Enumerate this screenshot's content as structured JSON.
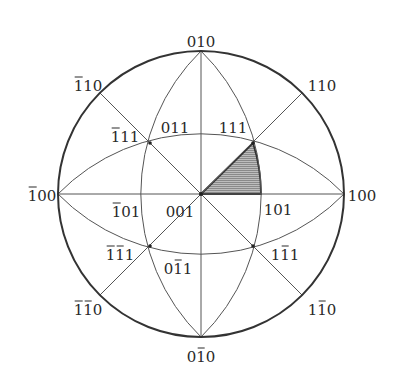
{
  "diagram": {
    "type": "stereographic-projection",
    "title": "",
    "colors": {
      "line": "#555555",
      "primitive_circle": "#333333",
      "shading": "#9a9a9a",
      "text": "#2a2a2a"
    },
    "center": [
      201,
      194
    ],
    "radius": 143,
    "shaded_region": {
      "description": "standard stereographic triangle 001-101-111",
      "vertices": [
        "001",
        "101",
        "111"
      ]
    },
    "poles": [
      {
        "id": "p010",
        "label": "010",
        "digits": [
          {
            "c": "0",
            "bar": false
          },
          {
            "c": "1",
            "bar": false
          },
          {
            "c": "0",
            "bar": false
          }
        ],
        "pos": [
          201,
          42
        ]
      },
      {
        "id": "p0m10",
        "label": "0̅1̅0",
        "digits": [
          {
            "c": "0",
            "bar": false
          },
          {
            "c": "1",
            "bar": true
          },
          {
            "c": "0",
            "bar": false
          }
        ],
        "pos": [
          201,
          357
        ]
      },
      {
        "id": "pm100",
        "label": "̅1 00",
        "digits": [
          {
            "c": "1",
            "bar": true
          },
          {
            "c": "0",
            "bar": false
          },
          {
            "c": "0",
            "bar": false
          }
        ],
        "pos": [
          42,
          196
        ]
      },
      {
        "id": "p100",
        "label": "100",
        "digits": [
          {
            "c": "1",
            "bar": false
          },
          {
            "c": "0",
            "bar": false
          },
          {
            "c": "0",
            "bar": false
          }
        ],
        "pos": [
          362,
          196
        ]
      },
      {
        "id": "pm110",
        "label": "-110",
        "digits": [
          {
            "c": "1",
            "bar": true
          },
          {
            "c": "1",
            "bar": false
          },
          {
            "c": "0",
            "bar": false
          }
        ],
        "pos": [
          88,
          86
        ]
      },
      {
        "id": "p110",
        "label": "110",
        "digits": [
          {
            "c": "1",
            "bar": false
          },
          {
            "c": "1",
            "bar": false
          },
          {
            "c": "0",
            "bar": false
          }
        ],
        "pos": [
          322,
          86
        ]
      },
      {
        "id": "pm1m10",
        "label": "-1-10",
        "digits": [
          {
            "c": "1",
            "bar": true
          },
          {
            "c": "1",
            "bar": true
          },
          {
            "c": "0",
            "bar": false
          }
        ],
        "pos": [
          88,
          310
        ]
      },
      {
        "id": "p1m10",
        "label": "1-10",
        "digits": [
          {
            "c": "1",
            "bar": false
          },
          {
            "c": "1",
            "bar": true
          },
          {
            "c": "0",
            "bar": false
          }
        ],
        "pos": [
          322,
          310
        ]
      },
      {
        "id": "pm111",
        "label": "-111",
        "digits": [
          {
            "c": "1",
            "bar": true
          },
          {
            "c": "1",
            "bar": false
          },
          {
            "c": "1",
            "bar": false
          }
        ],
        "pos": [
          125,
          137
        ]
      },
      {
        "id": "p011",
        "label": "011",
        "digits": [
          {
            "c": "0",
            "bar": false
          },
          {
            "c": "1",
            "bar": false
          },
          {
            "c": "1",
            "bar": false
          }
        ],
        "pos": [
          175,
          128
        ]
      },
      {
        "id": "p111",
        "label": "111",
        "digits": [
          {
            "c": "1",
            "bar": false
          },
          {
            "c": "1",
            "bar": false
          },
          {
            "c": "1",
            "bar": false
          }
        ],
        "pos": [
          233,
          128
        ]
      },
      {
        "id": "pm101",
        "label": "-101",
        "digits": [
          {
            "c": "1",
            "bar": true
          },
          {
            "c": "0",
            "bar": false
          },
          {
            "c": "1",
            "bar": false
          }
        ],
        "pos": [
          126,
          212
        ]
      },
      {
        "id": "p001",
        "label": "001",
        "digits": [
          {
            "c": "0",
            "bar": false
          },
          {
            "c": "0",
            "bar": false
          },
          {
            "c": "1",
            "bar": false
          }
        ],
        "pos": [
          180,
          212
        ]
      },
      {
        "id": "p101",
        "label": "101",
        "digits": [
          {
            "c": "1",
            "bar": false
          },
          {
            "c": "0",
            "bar": false
          },
          {
            "c": "1",
            "bar": false
          }
        ],
        "pos": [
          278,
          210
        ]
      },
      {
        "id": "pm1m11",
        "label": "-1-11",
        "digits": [
          {
            "c": "1",
            "bar": true
          },
          {
            "c": "1",
            "bar": true
          },
          {
            "c": "1",
            "bar": false
          }
        ],
        "pos": [
          120,
          255
        ]
      },
      {
        "id": "p0m11",
        "label": "0-11",
        "digits": [
          {
            "c": "0",
            "bar": false
          },
          {
            "c": "1",
            "bar": true
          },
          {
            "c": "1",
            "bar": false
          }
        ],
        "pos": [
          178,
          269
        ]
      },
      {
        "id": "p1m11",
        "label": "1-11",
        "digits": [
          {
            "c": "1",
            "bar": false
          },
          {
            "c": "1",
            "bar": true
          },
          {
            "c": "1",
            "bar": false
          }
        ],
        "pos": [
          285,
          255
        ]
      }
    ]
  }
}
